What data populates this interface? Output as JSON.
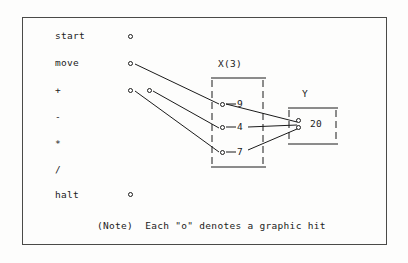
{
  "diagram": {
    "title_note": "(Note)  Each \"o\" denotes a graphic hit",
    "marker_glyph": "o",
    "frame_color": "#4a4a48",
    "ink_color": "#1b1b1b",
    "background_color": "#fdfdfc"
  },
  "operations": {
    "header": "",
    "rows": [
      {
        "label": "start",
        "has_marker": true,
        "marker_x": 130,
        "marker_y": 36
      },
      {
        "label": "move",
        "has_marker": true,
        "marker_x": 130,
        "marker_y": 63
      },
      {
        "label": "+",
        "has_marker": true,
        "marker_x": 130,
        "marker_y": 90
      },
      {
        "label": "-",
        "has_marker": false,
        "marker_x": 0,
        "marker_y": 0
      },
      {
        "label": "*",
        "has_marker": false,
        "marker_x": 0,
        "marker_y": 0
      },
      {
        "label": "/",
        "has_marker": false,
        "marker_x": 0,
        "marker_y": 0
      },
      {
        "label": "halt",
        "has_marker": true,
        "marker_x": 130,
        "marker_y": 194
      }
    ],
    "extra_marker": {
      "label_ref": "+",
      "marker_x": 149,
      "marker_y": 90
    }
  },
  "array_x": {
    "name": "X(3)",
    "cells": [
      {
        "value": "9",
        "marker_x": 222,
        "marker_y": 104,
        "value_x": 239,
        "value_y": 100
      },
      {
        "value": "4",
        "marker_x": 222,
        "marker_y": 127,
        "value_x": 239,
        "value_y": 123
      },
      {
        "value": "7",
        "marker_x": 222,
        "marker_y": 152,
        "value_x": 239,
        "value_y": 148
      }
    ]
  },
  "array_y": {
    "name": "Y",
    "cells": [
      {
        "value": "20",
        "marker_top_x": 298,
        "marker_top_y": 121,
        "marker_bottom_x": 298,
        "marker_bottom_y": 128,
        "value_x": 311,
        "value_y": 121
      }
    ]
  },
  "connections": [
    {
      "from": "move-marker",
      "to": "x-cell-9"
    },
    {
      "from": "plus-marker-a",
      "to": "x-cell-7"
    },
    {
      "from": "plus-marker-b",
      "to": "x-cell-4"
    },
    {
      "from": "x-cell-9",
      "to": "y-cell-20"
    },
    {
      "from": "x-cell-4",
      "to": "y-cell-20"
    },
    {
      "from": "x-cell-7",
      "to": "y-cell-20"
    }
  ]
}
